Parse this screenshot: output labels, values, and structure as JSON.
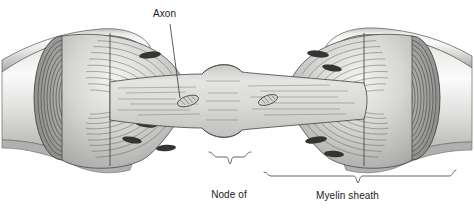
{
  "figure": {
    "type": "biological-illustration",
    "background_color": "#ffffff",
    "line_color": "#2b2b2b",
    "label_color": "#1c1c1c"
  },
  "labels": {
    "axon": "Axon",
    "node_line1": "Node of",
    "node_line2": "Ranvier",
    "myelin": "Myelin sheath"
  },
  "structures": {
    "axon": {
      "name": "axon",
      "description": "pale gray cytoplasmic core with horizontal striations",
      "fill": "#d8d8d6"
    },
    "myelin_sheath": {
      "name": "myelin-sheath",
      "description": "concentric lamellae wrapped around the axon",
      "fill": "#b9b9b7"
    },
    "node_of_ranvier": {
      "name": "node-of-ranvier",
      "description": "gap between adjacent myelin segments where the axon is exposed"
    },
    "schwann_cell_nuclei": {
      "name": "schwann-cell-nucleus",
      "count": 8,
      "fill": "#3a3a3a"
    },
    "mitochondria": {
      "name": "mitochondrion",
      "count": 2,
      "fill": "#cfcfcd"
    }
  },
  "colors": {
    "sheath_light": "#f2f2f1",
    "sheath_mid": "#cfcfcd",
    "sheath_dark": "#9a9a98",
    "cut_face_dark": "#8d8d8b",
    "axon_fill": "#dcdcda",
    "outline": "#2f2f2f",
    "nucleus": "#333333",
    "leader": "#333333"
  }
}
